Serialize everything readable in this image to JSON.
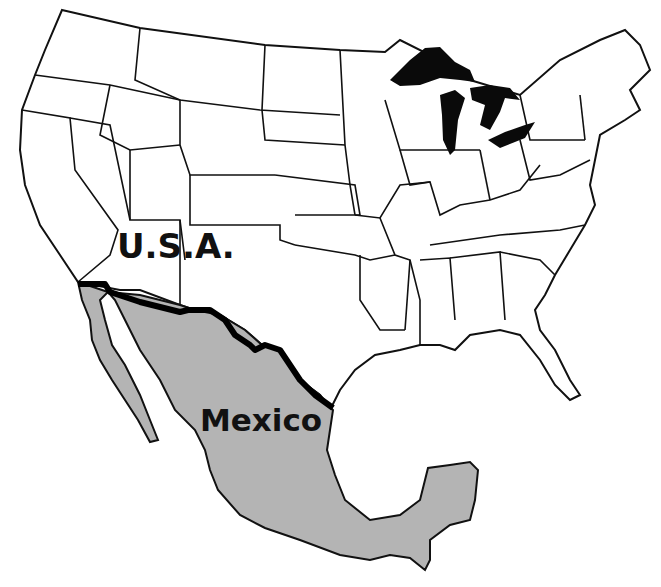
{
  "map": {
    "labels": {
      "usa": "U.S.A.",
      "mexico": "Mexico"
    },
    "colors": {
      "usa_fill": "#ffffff",
      "mexico_fill": "#b4b4b4",
      "great_lakes": "#0a0a0a",
      "state_lines": "#111111",
      "border_line": "#000000"
    },
    "features": [
      "USA state outlines",
      "Great Lakes (filled black)",
      "US–Mexico border (thick line)",
      "Mexico (gray fill)"
    ]
  }
}
